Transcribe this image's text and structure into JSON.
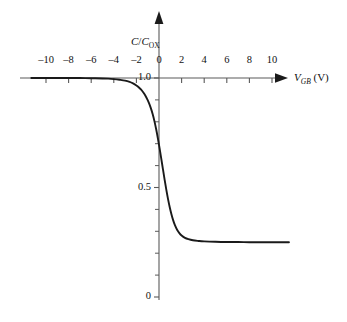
{
  "chart_data": {
    "type": "line",
    "title": "",
    "xlabel": "V_GB (V)",
    "ylabel": "C/C_OX",
    "xlabel_main": "V",
    "xlabel_sub": "GB",
    "xlabel_unit": "(V)",
    "ylabel_num": "C",
    "ylabel_den": "C",
    "ylabel_den_sub": "OX",
    "xlim": [
      -11.3,
      11.5
    ],
    "ylim": [
      0,
      1.05
    ],
    "grid": false,
    "legend": "none",
    "curve_color": "#1a1a1a",
    "axis_color": "#5a5a5a",
    "xticks": [
      -10,
      -8,
      -6,
      -4,
      -2,
      0,
      2,
      4,
      6,
      8,
      10
    ],
    "xtick_labels": [
      "–10",
      "–8",
      "–6",
      "–4",
      "–2",
      "0",
      "2",
      "4",
      "6",
      "8",
      "10"
    ],
    "yticks_major": [
      0,
      0.5,
      1.0
    ],
    "ytick_labels": [
      "0",
      "0.5",
      "1.0"
    ],
    "yticks_minor": [
      0.1,
      0.2,
      0.3,
      0.4,
      0.6,
      0.7,
      0.8,
      0.9
    ],
    "accumulation_level": 1.0,
    "inversion_level": 0.25,
    "threshold_voltage": 0.55,
    "series": [
      {
        "name": "C/Cox vs VGB",
        "x": [
          -11.3,
          -10,
          -9,
          -8,
          -7,
          -6,
          -5,
          -4.5,
          -4,
          -3.5,
          -3,
          -2.6,
          -2.3,
          -2.0,
          -1.8,
          -1.6,
          -1.4,
          -1.2,
          -1.0,
          -0.85,
          -0.7,
          -0.55,
          -0.4,
          -0.25,
          -0.1,
          0.05,
          0.2,
          0.35,
          0.5,
          0.65,
          0.8,
          0.95,
          1.1,
          1.25,
          1.4,
          1.6,
          1.8,
          2.0,
          2.3,
          2.6,
          3.0,
          3.5,
          4.0,
          5.0,
          6.0,
          7.0,
          8.0,
          9.0,
          10.0,
          11.5
        ],
        "y": [
          1.0,
          1.0,
          1.0,
          1.0,
          1.0,
          0.999,
          0.998,
          0.997,
          0.995,
          0.992,
          0.988,
          0.982,
          0.975,
          0.966,
          0.958,
          0.948,
          0.935,
          0.919,
          0.899,
          0.881,
          0.859,
          0.833,
          0.802,
          0.766,
          0.725,
          0.68,
          0.632,
          0.583,
          0.535,
          0.489,
          0.447,
          0.41,
          0.378,
          0.351,
          0.329,
          0.307,
          0.292,
          0.281,
          0.27,
          0.264,
          0.259,
          0.256,
          0.254,
          0.252,
          0.251,
          0.251,
          0.25,
          0.25,
          0.25,
          0.25
        ]
      }
    ]
  },
  "axes_geometry": {
    "origin_x_px": 159,
    "origin_y_px": 297,
    "x_axis_y_px": 78,
    "px_per_x_unit": 11.3,
    "px_per_y_unit": 219
  }
}
